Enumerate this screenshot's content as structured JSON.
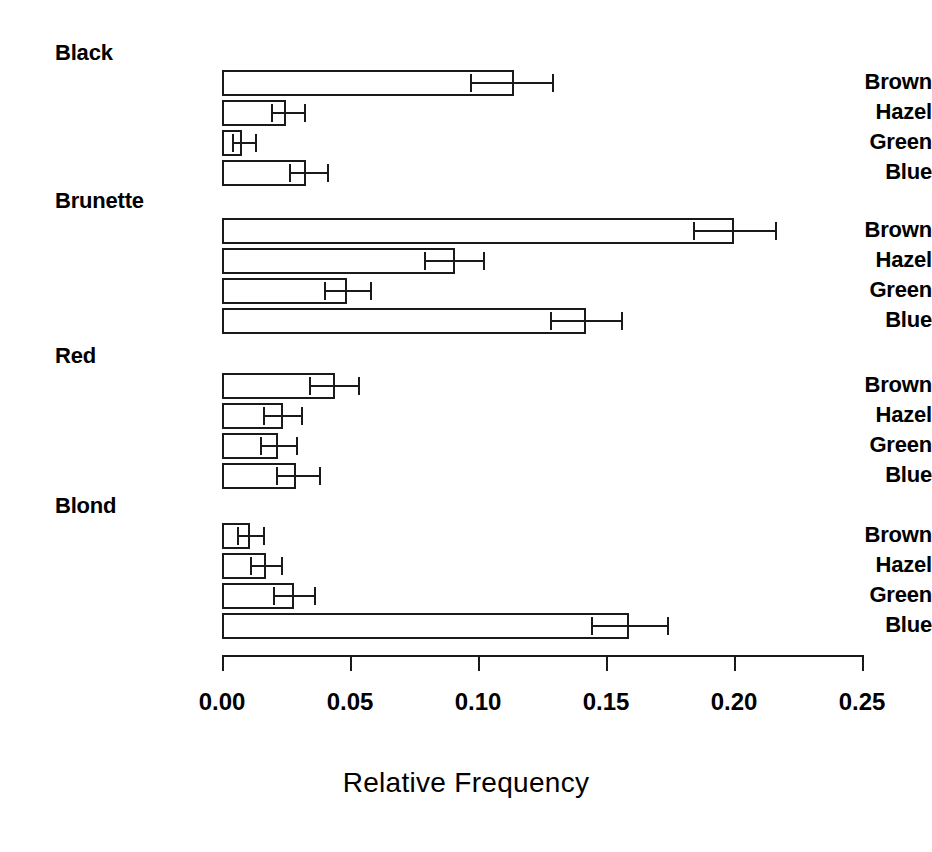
{
  "chart_data": {
    "type": "bar",
    "orientation": "horizontal",
    "title": "",
    "xlabel": "Relative Frequency",
    "ylabel": "",
    "xlim": [
      0.0,
      0.25
    ],
    "grid": false,
    "legend": null,
    "x_ticks": [
      {
        "value": 0.0,
        "label": "0.00"
      },
      {
        "value": 0.05,
        "label": "0.05"
      },
      {
        "value": 0.1,
        "label": "0.10"
      },
      {
        "value": 0.15,
        "label": "0.15"
      },
      {
        "value": 0.2,
        "label": "0.20"
      },
      {
        "value": 0.25,
        "label": "0.25"
      }
    ],
    "groups": [
      {
        "name": "Black",
        "categories": [
          "Brown",
          "Hazel",
          "Green",
          "Blue"
        ],
        "values": [
          0.114,
          0.025,
          0.008,
          0.033
        ],
        "err_low": [
          0.097,
          0.019,
          0.004,
          0.026
        ],
        "err_high": [
          0.129,
          0.032,
          0.013,
          0.041
        ]
      },
      {
        "name": "Brunette",
        "categories": [
          "Brown",
          "Hazel",
          "Green",
          "Blue"
        ],
        "values": [
          0.2,
          0.091,
          0.049,
          0.142
        ],
        "err_low": [
          0.184,
          0.079,
          0.04,
          0.128
        ],
        "err_high": [
          0.216,
          0.102,
          0.058,
          0.156
        ]
      },
      {
        "name": "Red",
        "categories": [
          "Brown",
          "Hazel",
          "Green",
          "Blue"
        ],
        "values": [
          0.044,
          0.024,
          0.022,
          0.029
        ],
        "err_low": [
          0.034,
          0.016,
          0.015,
          0.021
        ],
        "err_high": [
          0.053,
          0.031,
          0.029,
          0.038
        ]
      },
      {
        "name": "Blond",
        "categories": [
          "Brown",
          "Hazel",
          "Green",
          "Blue"
        ],
        "values": [
          0.011,
          0.017,
          0.028,
          0.159
        ],
        "err_low": [
          0.006,
          0.011,
          0.02,
          0.144
        ],
        "err_high": [
          0.016,
          0.023,
          0.036,
          0.174
        ]
      }
    ]
  },
  "axis": {
    "title": "Relative Frequency"
  },
  "colors": {
    "ink": "#1a1a1a",
    "background": "#ffffff"
  }
}
